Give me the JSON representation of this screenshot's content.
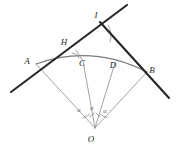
{
  "figure": {
    "background_color": "#ffffff",
    "stroke_colors": {
      "heavy_line": "#262626",
      "thin_line": "#8a8a8a",
      "arc": "#7a7a7a",
      "label_text": "#2b2b2b",
      "angle_text": "#6a6a6a"
    },
    "points": {
      "A": {
        "label": "A",
        "x": 36,
        "y": 64,
        "label_x": 27,
        "label_y": 64
      },
      "B": {
        "label": "B",
        "x": 147,
        "y": 72,
        "label_x": 152,
        "label_y": 73
      },
      "C": {
        "label": "C",
        "x": 83,
        "y": 61,
        "label_x": 82,
        "label_y": 66
      },
      "D": {
        "label": "D",
        "x": 115,
        "y": 63,
        "label_x": 113,
        "label_y": 68
      },
      "H": {
        "label": "H",
        "x": 76,
        "y": 50,
        "label_x": 64,
        "label_y": 45
      },
      "I": {
        "label": "I",
        "x": 100,
        "y": 22,
        "label_x": 96,
        "label_y": 18
      },
      "O": {
        "label": "O",
        "x": 95,
        "y": 128,
        "label_x": 91,
        "label_y": 142
      }
    },
    "angle_labels": [
      {
        "name": "alpha-left",
        "text": "α",
        "x": 79,
        "y": 112
      },
      {
        "name": "alpha-middle",
        "text": "α",
        "x": 92,
        "y": 110
      },
      {
        "name": "alpha-right",
        "text": "α",
        "x": 105,
        "y": 113
      }
    ],
    "heavy_lines": [
      {
        "name": "line-A-I-extended",
        "x1": 11,
        "y1": 92,
        "x2": 127,
        "y2": 5
      },
      {
        "name": "line-I-B-extended",
        "x1": 100,
        "y1": 22,
        "x2": 169,
        "y2": 98
      }
    ],
    "thin_lines": [
      {
        "name": "radius-OA",
        "x1": 95,
        "y1": 128,
        "x2": 36,
        "y2": 64
      },
      {
        "name": "radius-OC",
        "x1": 95,
        "y1": 128,
        "x2": 83,
        "y2": 61
      },
      {
        "name": "radius-OD",
        "x1": 95,
        "y1": 128,
        "x2": 115,
        "y2": 63
      },
      {
        "name": "radius-OB",
        "x1": 95,
        "y1": 128,
        "x2": 147,
        "y2": 72
      },
      {
        "name": "segment-CH",
        "x1": 83,
        "y1": 61,
        "x2": 76,
        "y2": 50
      }
    ],
    "arc": {
      "name": "arc-A-to-B",
      "path": "M 36 64 Q 92 44 147 72",
      "description": "circular arc from A through C and D to B"
    },
    "angle_marks": [
      {
        "name": "angle-mark-at-I",
        "path": "M 108 25 Q 113 33 110 42"
      },
      {
        "name": "angle-mark-at-H",
        "path": "M 72 53 Q 78 54 79 58"
      },
      {
        "name": "angle-mark-alpha-left",
        "path": "M 83 118 Q 88 116 90 114"
      },
      {
        "name": "angle-mark-alpha-mid-left",
        "path": "M 90 117 Q 93 115 94 113"
      },
      {
        "name": "angle-mark-alpha-mid-right",
        "path": "M 96 113 Q 98 115 100 117"
      },
      {
        "name": "angle-mark-alpha-right",
        "path": "M 100 114 Q 103 116 107 118"
      }
    ]
  }
}
